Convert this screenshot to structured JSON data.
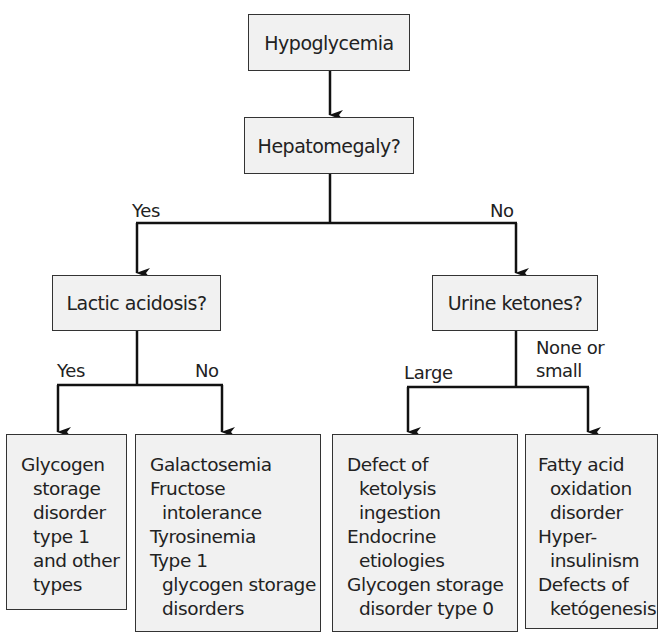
{
  "diagram": {
    "type": "flowchart",
    "nodes": {
      "root": "Hypoglycemia",
      "q1": "Hepatomegaly?",
      "q2_left": "Lactic acidosis?",
      "q2_right": "Urine ketones?"
    },
    "edge_labels": {
      "hepatomegaly_yes": "Yes",
      "hepatomegaly_no": "No",
      "lactic_yes": "Yes",
      "lactic_no": "No",
      "ketones_large": "Large",
      "ketones_none_line1": "None or",
      "ketones_none_line2": "small"
    },
    "outcomes": {
      "a": [
        "Glycogen",
        "storage",
        "disorder",
        "type 1",
        "and other",
        "types"
      ],
      "b": [
        "Galactosemia",
        "Fructose",
        "intolerance",
        "Tyrosinemia",
        "Type 1",
        "glycogen storage",
        "disorders"
      ],
      "c": [
        "Defect of",
        "ketolysis",
        "ingestion",
        "Endocrine",
        "etiologies",
        "Glycogen storage",
        "disorder type 0"
      ],
      "d": [
        "Fatty acid",
        "oxidation",
        "disorder",
        "Hyper-",
        "insulinism",
        "Defects of",
        "ketógenesis"
      ]
    }
  }
}
